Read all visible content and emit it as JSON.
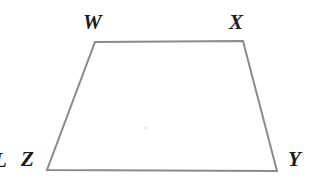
{
  "figure": {
    "kind": "geometry-diagram",
    "shape": "trapezoid",
    "name": "WXYZ",
    "background_color": "#ffffff",
    "stroke_color": "#8a8a8a",
    "stroke_width": 2,
    "label_color": "#1b1b1b",
    "canvas": {
      "width": 317,
      "height": 182
    },
    "vertices": [
      {
        "label": "W",
        "x": 95,
        "y": 42,
        "label_x": 83,
        "label_y": 12
      },
      {
        "label": "X",
        "x": 243,
        "y": 41,
        "label_x": 229,
        "label_y": 12
      },
      {
        "label": "Y",
        "x": 277,
        "y": 171,
        "label_x": 288,
        "label_y": 149
      },
      {
        "label": "Z",
        "x": 47,
        "y": 170,
        "label_x": 21,
        "label_y": 149
      }
    ],
    "edges": [
      {
        "from": "W",
        "to": "X",
        "name": "top-edge"
      },
      {
        "from": "X",
        "to": "Y",
        "name": "right-edge"
      },
      {
        "from": "Y",
        "to": "Z",
        "name": "bottom-edge"
      },
      {
        "from": "Z",
        "to": "W",
        "name": "left-edge"
      }
    ],
    "polygon_points": "95,42 243,41 277,171 47,170",
    "artifacts": {
      "edge_glyph": "L",
      "speck_color": "#d9d2d2"
    }
  }
}
